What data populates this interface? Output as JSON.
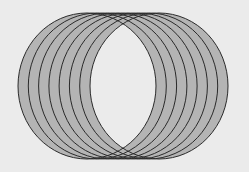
{
  "diagram": {
    "type": "overlapping-circles",
    "background": "#ebebeb",
    "fill": "#b4b4b4",
    "stroke": "#2a2a2a",
    "count": 8,
    "rx": 69,
    "ry": 73,
    "cy": 86,
    "centers_x": [
      87,
      97.3,
      107.6,
      117.9,
      128.1,
      138.4,
      148.7,
      159
    ]
  }
}
